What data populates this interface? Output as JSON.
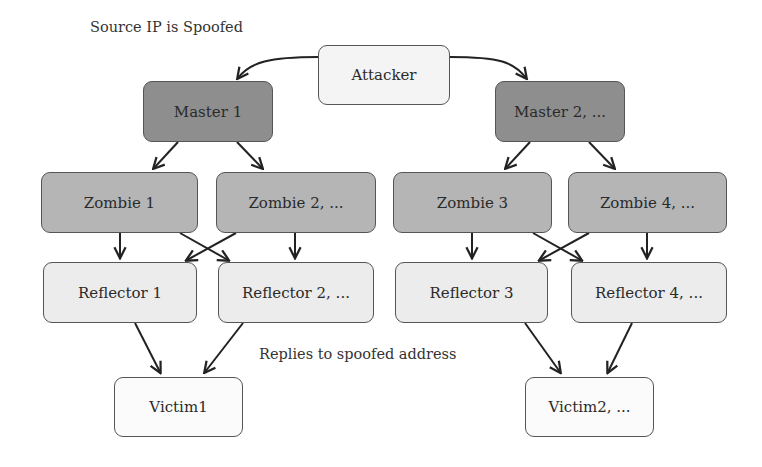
{
  "diagram": {
    "annotations": {
      "source_spoofed": "Source IP is Spoofed",
      "replies": "Replies to spoofed address"
    },
    "nodes": {
      "attacker": {
        "label": "Attacker",
        "type": "attacker"
      },
      "master1": {
        "label": "Master 1",
        "type": "master"
      },
      "master2": {
        "label": "Master 2, ...",
        "type": "master"
      },
      "zombie1": {
        "label": "Zombie 1",
        "type": "zombie"
      },
      "zombie2": {
        "label": "Zombie 2, ...",
        "type": "zombie"
      },
      "zombie3": {
        "label": "Zombie 3",
        "type": "zombie"
      },
      "zombie4": {
        "label": "Zombie 4, ...",
        "type": "zombie"
      },
      "reflector1": {
        "label": "Reflector 1",
        "type": "reflector"
      },
      "reflector2": {
        "label": "Reflector 2, ...",
        "type": "reflector"
      },
      "reflector3": {
        "label": "Reflector 3",
        "type": "reflector"
      },
      "reflector4": {
        "label": "Reflector 4, ...",
        "type": "reflector"
      },
      "victim1": {
        "label": "Victim1",
        "type": "victim"
      },
      "victim2": {
        "label": "Victim2, ...",
        "type": "victim"
      }
    },
    "edges": [
      {
        "from": "attacker",
        "to": "master1"
      },
      {
        "from": "attacker",
        "to": "master2"
      },
      {
        "from": "master1",
        "to": "zombie1"
      },
      {
        "from": "master1",
        "to": "zombie2"
      },
      {
        "from": "master2",
        "to": "zombie3"
      },
      {
        "from": "master2",
        "to": "zombie4"
      },
      {
        "from": "zombie1",
        "to": "reflector1"
      },
      {
        "from": "zombie1",
        "to": "reflector2"
      },
      {
        "from": "zombie2",
        "to": "reflector1"
      },
      {
        "from": "zombie2",
        "to": "reflector2"
      },
      {
        "from": "zombie3",
        "to": "reflector3"
      },
      {
        "from": "zombie3",
        "to": "reflector4"
      },
      {
        "from": "zombie4",
        "to": "reflector3"
      },
      {
        "from": "zombie4",
        "to": "reflector4"
      },
      {
        "from": "reflector1",
        "to": "victim1"
      },
      {
        "from": "reflector2",
        "to": "victim1"
      },
      {
        "from": "reflector3",
        "to": "victim2"
      },
      {
        "from": "reflector4",
        "to": "victim2"
      }
    ],
    "colors": {
      "attacker": "#f4f4f4",
      "master": "#8e8e8e",
      "zombie": "#b5b5b5",
      "reflector": "#ececec",
      "victim": "#fbfbfb",
      "stroke": "#222222"
    }
  }
}
